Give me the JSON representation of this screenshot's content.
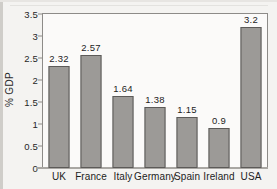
{
  "chart_data": {
    "type": "bar",
    "title": "",
    "xlabel": "",
    "ylabel": "% GDP",
    "categories": [
      "UK",
      "France",
      "Italy",
      "Germany",
      "Spain",
      "Ireland",
      "USA"
    ],
    "values": [
      2.32,
      2.57,
      1.64,
      1.38,
      1.15,
      0.9,
      3.2
    ],
    "value_labels": [
      "2.32",
      "2.57",
      "1.64",
      "1.38",
      "1.15",
      "0.9",
      "3.2"
    ],
    "ylim": [
      0,
      3.5
    ],
    "ytick_values": [
      0,
      0.5,
      1,
      1.5,
      2,
      2.5,
      3,
      3.5
    ],
    "ytick_labels": [
      "0",
      "0.5",
      "1",
      "1.5",
      "2",
      "2.5",
      "3",
      "3.5"
    ],
    "grid": false,
    "legend": null,
    "bar_color": "#9c9a97",
    "bar_border_color": "#5c5a58",
    "axis_color": "#8d8b88",
    "text_color": "#1d1d1d",
    "background_color": "#f4f3f1",
    "plot_background_color": "#fbfaf9"
  }
}
